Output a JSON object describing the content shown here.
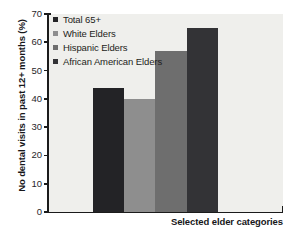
{
  "chart_data": {
    "type": "bar",
    "title": "",
    "subtitle": "",
    "xlabel": "Selected elder categories",
    "ylabel": "No dental visits in past 12+ months (%)",
    "categories": [
      "Total 65+",
      "White Elders",
      "Hispanic Elders",
      "African American Elders"
    ],
    "values": [
      44,
      40,
      57,
      65
    ],
    "series": [
      {
        "name": "No dental visits in past 12+ months (%)",
        "values": [
          44,
          40,
          57,
          65
        ]
      }
    ],
    "colors": [
      "#232326",
      "#8e8e8e",
      "#6e6e6e",
      "#333336"
    ],
    "ylim": [
      0,
      70
    ],
    "ytick_step": 10,
    "yticks": [
      0,
      10,
      20,
      30,
      40,
      50,
      60,
      70
    ],
    "ytick_labels": [
      "0",
      "10",
      "20",
      "30",
      "40",
      "50",
      "60",
      "70"
    ],
    "grid": false,
    "legend_position": "upper-left",
    "plot_background": "#efefec",
    "axis_color": "#1b1b1b"
  },
  "legend": {
    "items": [
      {
        "label": "Total 65+",
        "color": "#232326"
      },
      {
        "label": "White Elders",
        "color": "#8e8e8e"
      },
      {
        "label": "Hispanic Elders",
        "color": "#6e6e6e"
      },
      {
        "label": "African American Elders",
        "color": "#333336"
      }
    ]
  },
  "axes": {
    "y_title": "No dental visits in past 12+ months (%)",
    "x_title": "Selected elder categories"
  }
}
